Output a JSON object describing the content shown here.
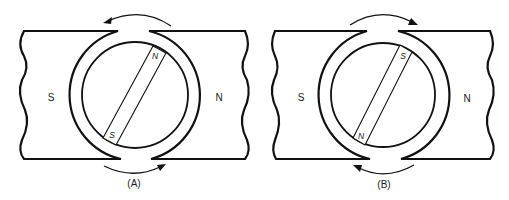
{
  "figure": {
    "panels": [
      {
        "id": "A",
        "caption": "(A)",
        "stator_left_pole": "S",
        "stator_right_pole": "N",
        "rotor_upper_pole": "N",
        "rotor_lower_pole": "S",
        "top_arrow_direction": "counterclockwise (left)",
        "bottom_arrow_direction": "right"
      },
      {
        "id": "B",
        "caption": "(B)",
        "stator_left_pole": "S",
        "stator_right_pole": "N",
        "rotor_upper_pole": "S",
        "rotor_lower_pole": "N",
        "top_arrow_direction": "clockwise (right)",
        "bottom_arrow_direction": "left"
      }
    ]
  },
  "colors": {
    "line": "#111111",
    "background": "#ffffff"
  }
}
